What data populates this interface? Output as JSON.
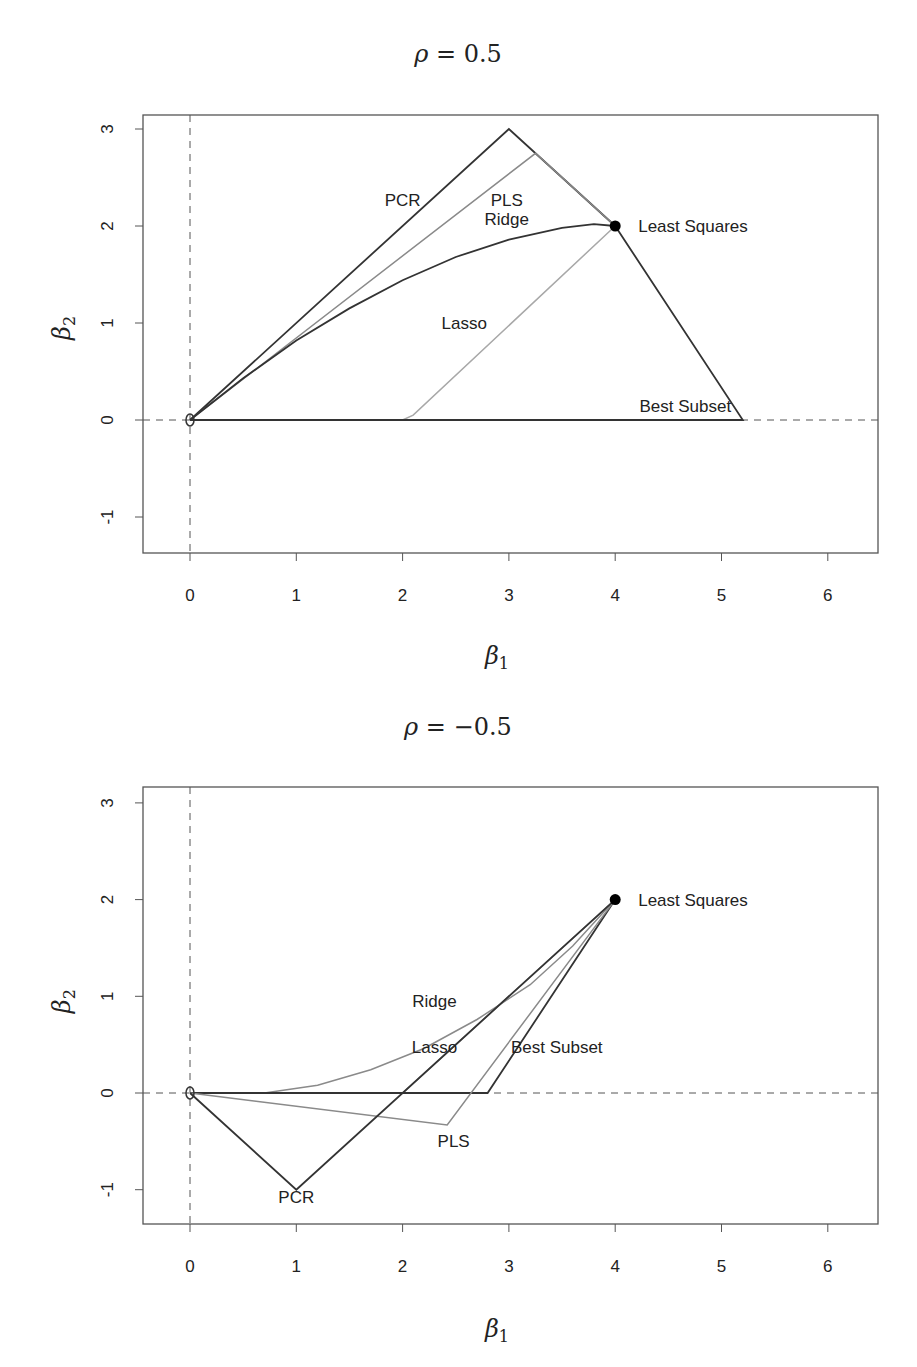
{
  "chart_data": [
    {
      "type": "line",
      "title": "ρ = 0.5",
      "xlabel": "β1",
      "ylabel": "β2",
      "xlim": [
        -0.45,
        6.5
      ],
      "ylim": [
        -1.35,
        3.17
      ],
      "xticks": [
        0,
        1,
        2,
        3,
        4,
        5,
        6
      ],
      "yticks": [
        -1,
        0,
        1,
        2,
        3
      ],
      "grid": false,
      "reference_lines": {
        "x": 0,
        "y": 0,
        "style": "dashed"
      },
      "origin_marker": {
        "x": 0,
        "y": 0,
        "label": "0"
      },
      "least_squares": {
        "x": 4,
        "y": 2,
        "label": "Least Squares"
      },
      "series": [
        {
          "name": "PCR",
          "color": "#333333",
          "points": [
            [
              0,
              0
            ],
            [
              3,
              3
            ],
            [
              4,
              2
            ]
          ],
          "label_pos": [
            2.0,
            2.27
          ]
        },
        {
          "name": "PLS",
          "color": "#8a8a8a",
          "points": [
            [
              0,
              0
            ],
            [
              3.25,
              2.75
            ],
            [
              4,
              2
            ]
          ],
          "label_pos": [
            2.98,
            2.27
          ]
        },
        {
          "name": "Ridge",
          "color": "#333333",
          "points": [
            [
              0,
              0
            ],
            [
              0.5,
              0.43
            ],
            [
              1,
              0.82
            ],
            [
              1.5,
              1.15
            ],
            [
              2,
              1.44
            ],
            [
              2.5,
              1.68
            ],
            [
              3,
              1.86
            ],
            [
              3.5,
              1.98
            ],
            [
              3.8,
              2.02
            ],
            [
              4,
              2
            ]
          ],
          "label_pos": [
            2.98,
            2.07
          ]
        },
        {
          "name": "Lasso",
          "color": "#a8a8a8",
          "points": [
            [
              0,
              0
            ],
            [
              2,
              0
            ],
            [
              2.1,
              0.05
            ],
            [
              4,
              2
            ]
          ],
          "label_pos": [
            2.58,
            1.0
          ]
        },
        {
          "name": "Best Subset",
          "color": "#333333",
          "points": [
            [
              0,
              0
            ],
            [
              5.2,
              0
            ],
            [
              4,
              2
            ]
          ],
          "label_pos": [
            4.66,
            0.14
          ]
        }
      ]
    },
    {
      "type": "line",
      "title": "ρ = −0.5",
      "xlabel": "β1",
      "ylabel": "β2",
      "xlim": [
        -0.45,
        6.5
      ],
      "ylim": [
        -1.35,
        3.17
      ],
      "xticks": [
        0,
        1,
        2,
        3,
        4,
        5,
        6
      ],
      "yticks": [
        -1,
        0,
        1,
        2,
        3
      ],
      "grid": false,
      "reference_lines": {
        "x": 0,
        "y": 0,
        "style": "dashed"
      },
      "origin_marker": {
        "x": 0,
        "y": 0,
        "label": "0"
      },
      "least_squares": {
        "x": 4,
        "y": 2,
        "label": "Least Squares"
      },
      "series": [
        {
          "name": "Ridge",
          "color": "#8a8a8a",
          "points": [
            [
              0,
              0
            ],
            [
              0.7,
              0
            ],
            [
              1.2,
              0.08
            ],
            [
              1.7,
              0.24
            ],
            [
              2.2,
              0.46
            ],
            [
              2.7,
              0.76
            ],
            [
              3.2,
              1.12
            ],
            [
              3.6,
              1.52
            ],
            [
              4,
              2
            ]
          ],
          "label_pos": [
            2.3,
            0.95
          ]
        },
        {
          "name": "Lasso",
          "color": "#9a9a9a",
          "points": [
            [
              0,
              0
            ],
            [
              2,
              0
            ],
            [
              4,
              2
            ]
          ],
          "label_pos": [
            2.3,
            0.48
          ]
        },
        {
          "name": "Best Subset",
          "color": "#333333",
          "points": [
            [
              0,
              0
            ],
            [
              2.8,
              0
            ],
            [
              4,
              2
            ]
          ],
          "label_pos": [
            3.45,
            0.48
          ]
        },
        {
          "name": "PLS",
          "color": "#8a8a8a",
          "points": [
            [
              0,
              0
            ],
            [
              2.42,
              -0.33
            ],
            [
              4,
              2
            ]
          ],
          "label_pos": [
            2.48,
            -0.5
          ]
        },
        {
          "name": "PCR",
          "color": "#333333",
          "points": [
            [
              0,
              0
            ],
            [
              1,
              -1
            ],
            [
              4,
              2
            ]
          ],
          "label_pos": [
            1.0,
            -1.08
          ]
        }
      ]
    }
  ],
  "panels": [
    {
      "title_rho": "ρ",
      "title_eq": " = 0.5",
      "xlabel_sym": "β",
      "xlabel_sub": "1",
      "ylabel_sym": "β",
      "ylabel_sub": "2"
    },
    {
      "title_rho": "ρ",
      "title_eq": " = −0.5",
      "xlabel_sym": "β",
      "xlabel_sub": "1",
      "ylabel_sym": "β",
      "ylabel_sub": "2"
    }
  ]
}
